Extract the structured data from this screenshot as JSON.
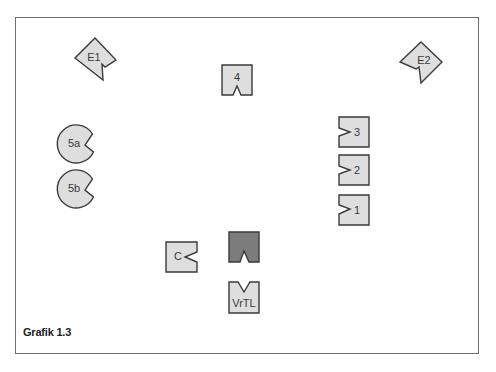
{
  "figure": {
    "caption": "Grafik 1.3",
    "colors": {
      "frame": "#6e6e6e",
      "shape_fill": "#dedede",
      "shape_fill_dark": "#7c7c7c",
      "stroke": "#3a3a3a",
      "label": "#3a3a3a"
    }
  },
  "nodes": {
    "e1": {
      "label": "E1",
      "shape": "diamond",
      "notch": "lower-right"
    },
    "e2": {
      "label": "E2",
      "shape": "diamond",
      "notch": "lower-left"
    },
    "n4": {
      "label": "4",
      "shape": "square",
      "notch": "bottom"
    },
    "n5a": {
      "label": "5a",
      "shape": "circle",
      "notch": "right"
    },
    "n5b": {
      "label": "5b",
      "shape": "circle",
      "notch": "right"
    },
    "n3": {
      "label": "3",
      "shape": "square",
      "notch": "left"
    },
    "n2": {
      "label": "2",
      "shape": "square",
      "notch": "left"
    },
    "n1": {
      "label": "1",
      "shape": "square",
      "notch": "left"
    },
    "c": {
      "label": "C",
      "shape": "square",
      "notch": "right"
    },
    "dark": {
      "label": "",
      "shape": "square",
      "notch": "bottom",
      "fill": "dark"
    },
    "vrtl": {
      "label": "VrTL",
      "shape": "square",
      "notch": "top"
    }
  }
}
